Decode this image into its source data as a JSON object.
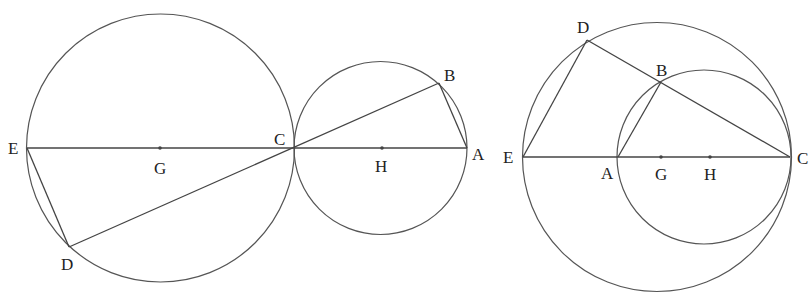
{
  "figures": [
    {
      "id": "left",
      "description": "Two externally tangent circles touching at C; diameters EC and CA collinear; chords ED, DC, CB, BA",
      "circles": [
        {
          "name": "circle-G",
          "cx": 160.5,
          "cy": 148,
          "r": 134
        },
        {
          "name": "circle-H",
          "cx": 380.5,
          "cy": 148,
          "r": 86.5
        }
      ],
      "points": {
        "E": {
          "x": 27,
          "y": 148,
          "label": "E",
          "lx": 8,
          "ly": 154
        },
        "G": {
          "x": 160,
          "y": 148,
          "label": "G",
          "lx": 154,
          "ly": 174,
          "dot": true
        },
        "C": {
          "x": 294,
          "y": 148,
          "label": "C",
          "lx": 274,
          "ly": 145
        },
        "H": {
          "x": 382,
          "y": 148,
          "label": "H",
          "lx": 375,
          "ly": 172,
          "dot": true
        },
        "A": {
          "x": 467,
          "y": 148,
          "label": "A",
          "lx": 472,
          "ly": 160
        },
        "B": {
          "x": 439,
          "y": 83,
          "label": "B",
          "lx": 444,
          "ly": 81
        },
        "D": {
          "x": 69,
          "y": 247,
          "label": "D",
          "lx": 61,
          "ly": 270
        }
      },
      "segments": [
        [
          "E",
          "A"
        ],
        [
          "E",
          "D"
        ],
        [
          "D",
          "B"
        ],
        [
          "B",
          "A"
        ]
      ]
    },
    {
      "id": "right",
      "description": "Two internally tangent circles touching at C; E, A, G, H, C collinear; D on large circle, B on small circle; chords ED, DC, AB",
      "circles": [
        {
          "name": "circle-G",
          "cx": 657,
          "cy": 157,
          "r": 134.5
        },
        {
          "name": "circle-H",
          "cx": 704,
          "cy": 157,
          "r": 87
        }
      ],
      "points": {
        "E": {
          "x": 523,
          "y": 157,
          "label": "E",
          "lx": 503,
          "ly": 163
        },
        "A": {
          "x": 618,
          "y": 157,
          "label": "A",
          "lx": 601,
          "ly": 179
        },
        "G": {
          "x": 661,
          "y": 157,
          "label": "G",
          "lx": 655,
          "ly": 180,
          "dot": true
        },
        "H": {
          "x": 710,
          "y": 157,
          "label": "H",
          "lx": 704,
          "ly": 180,
          "dot": true
        },
        "C": {
          "x": 790,
          "y": 157,
          "label": "C",
          "lx": 797,
          "ly": 164
        },
        "D": {
          "x": 587,
          "y": 40,
          "label": "D",
          "lx": 577,
          "ly": 33
        },
        "B": {
          "x": 661,
          "y": 82,
          "label": "B",
          "lx": 656,
          "ly": 76
        }
      },
      "segments": [
        [
          "E",
          "C"
        ],
        [
          "E",
          "D"
        ],
        [
          "D",
          "C"
        ],
        [
          "A",
          "B"
        ]
      ]
    }
  ],
  "labels": {
    "left": [
      "E",
      "G",
      "C",
      "H",
      "A",
      "B",
      "D"
    ],
    "right": [
      "E",
      "A",
      "G",
      "H",
      "C",
      "D",
      "B"
    ]
  }
}
